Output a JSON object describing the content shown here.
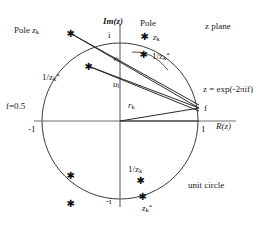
{
  "figure": {
    "title": "z plane",
    "unit_circle_label": "unit circle",
    "axis": {
      "imaginary_label": "Im(z)",
      "real_label": "R(z)",
      "tick_i": "i",
      "tick_minus_i": "-i",
      "tick_one": "1",
      "tick_minus_one": "-1"
    },
    "annotations": {
      "pole_left": "Pole",
      "pole_left_sym": "z",
      "pole_left_sub": "k",
      "pole_right": "Pole",
      "pole_right_sym": "z",
      "pole_right_sub": "k",
      "f_half": "f=0.5",
      "f_point": "f",
      "z_exp": "z = exp(-2πif)",
      "vec_v": "v",
      "vec_v_sub": "l",
      "vec_u": "u",
      "vec_u_sub": "l",
      "vec_r": "r",
      "vec_r_sub": "k",
      "inv_conj_left_num": "1/z",
      "inv_conj_left_sub": "k",
      "inv_conj_left_star": "*",
      "inv_conj_right_num": "1/z",
      "inv_conj_right_sub": "k",
      "inv_conj_right_star": "*",
      "inv_lower_num": "1/z",
      "inv_lower_sub": "k",
      "conj_lower_sym": "z",
      "conj_lower_sub": "k",
      "conj_lower_star": "*"
    },
    "geometry": {
      "center_x": 120,
      "center_y": 121,
      "radius": 78,
      "f_point_x": 199,
      "f_point_y": 121
    },
    "markers": [
      {
        "name": "pole-zk-upper-left-outside",
        "x": 70,
        "y": 33
      },
      {
        "name": "pole-zk-upper-right-outside",
        "x": 144,
        "y": 36
      },
      {
        "name": "inv-conj-zk-upper-right-inside",
        "x": 143,
        "y": 54
      },
      {
        "name": "inv-conj-zk-upper-left-inside",
        "x": 88,
        "y": 66
      },
      {
        "name": "conj-pole-lower-left-inside",
        "x": 70,
        "y": 175
      },
      {
        "name": "inv-zk-lower-right-inside",
        "x": 140,
        "y": 180
      },
      {
        "name": "conj-zk-lower-right-edge",
        "x": 142,
        "y": 196
      },
      {
        "name": "conj-pole-lower-left-outside",
        "x": 70,
        "y": 203
      }
    ],
    "colors": {
      "stroke": "#3a3a3a",
      "axis": "#6e6e6e",
      "text": "#1a1a1a",
      "background": "#ffffff"
    }
  }
}
